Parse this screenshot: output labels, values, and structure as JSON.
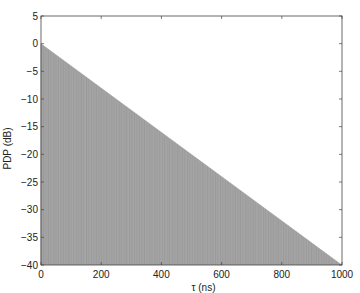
{
  "chart_data": {
    "type": "bar",
    "subtype": "stem",
    "title": "",
    "xlabel": "τ (ns)",
    "ylabel": "PDP (dB)",
    "xlim": [
      0,
      1000
    ],
    "ylim": [
      -40,
      5
    ],
    "xticks": [
      0,
      200,
      400,
      600,
      800,
      1000
    ],
    "yticks": [
      5,
      0,
      -5,
      -10,
      -15,
      -20,
      -25,
      -30,
      -35,
      -40
    ],
    "grid": false,
    "legend": null,
    "series": [
      {
        "name": "PDP",
        "description": "Dense stems with linear decay in dB from 0 dB at 0 ns to -40 dB at 1000 ns",
        "x": [
          0,
          100,
          200,
          300,
          400,
          500,
          600,
          700,
          800,
          900,
          1000
        ],
        "values": [
          0,
          -4,
          -8,
          -12,
          -16,
          -20,
          -24,
          -28,
          -32,
          -36,
          -40
        ],
        "color": "#8a8a8a"
      }
    ],
    "envelope": {
      "start": [
        0,
        0
      ],
      "end": [
        1000,
        -40
      ],
      "slope_db_per_ns": -0.04
    }
  },
  "colors": {
    "stem": "#8a8a8a",
    "stem_dark": "#6f6f6f",
    "axis": "#444444",
    "background": "#ffffff"
  }
}
